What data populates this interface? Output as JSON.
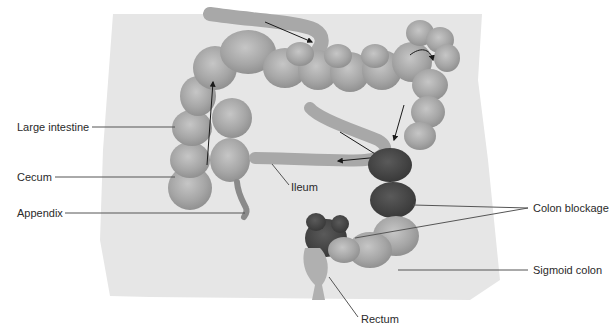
{
  "diagram": {
    "colors": {
      "background_panel": "#e6e6e6",
      "intestine_fill": "#a8a8a8",
      "intestine_highlight": "#c4c4c4",
      "intestine_shadow": "#8a8a8a",
      "blockage_fill": "#4a4a4a",
      "leader_line": "#555555",
      "arrow": "#1a1a1a",
      "text": "#2a2a2a"
    },
    "labels": [
      {
        "id": "large-intestine",
        "text": "Large intestine",
        "x": 17,
        "y": 121
      },
      {
        "id": "cecum",
        "text": "Cecum",
        "x": 17,
        "y": 171
      },
      {
        "id": "appendix",
        "text": "Appendix",
        "x": 17,
        "y": 207
      },
      {
        "id": "ileum",
        "text": "Ileum",
        "x": 291,
        "y": 181
      },
      {
        "id": "colon-blockage",
        "text": "Colon blockage",
        "x": 533,
        "y": 204
      },
      {
        "id": "sigmoid-colon",
        "text": "Sigmoid colon",
        "x": 533,
        "y": 265
      },
      {
        "id": "rectum",
        "text": "Rectum",
        "x": 361,
        "y": 313
      }
    ]
  }
}
